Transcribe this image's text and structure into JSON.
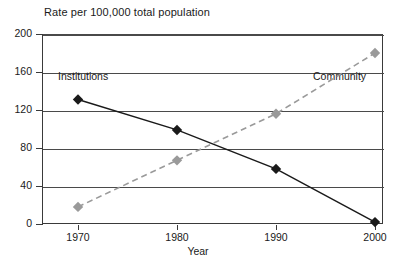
{
  "chart_data": {
    "type": "line",
    "title": "Rate per 100,000 total population",
    "xlabel": "Year",
    "ylabel": "",
    "categories": [
      "1970",
      "1980",
      "1990",
      "2000"
    ],
    "x": [
      1970,
      1980,
      1990,
      2000
    ],
    "xlim": [
      1970,
      2000
    ],
    "ylim": [
      0,
      200
    ],
    "yticks": [
      0,
      40,
      80,
      120,
      160,
      200
    ],
    "ytick_labels": [
      "0",
      "40",
      "80",
      "120",
      "160",
      "200"
    ],
    "grid": true,
    "legend_position": "inline-annotations",
    "series": [
      {
        "name": "Institutions",
        "values": [
          131,
          99,
          58,
          2
        ],
        "color": "#1a1a1a",
        "line_style": "solid",
        "marker": "diamond"
      },
      {
        "name": "Community",
        "values": [
          18,
          67,
          116,
          180
        ],
        "color": "#9a9a9a",
        "line_style": "dashed",
        "marker": "diamond"
      }
    ],
    "annotations": [
      {
        "text": "Institutions",
        "series": "Institutions"
      },
      {
        "text": "Community",
        "series": "Community"
      }
    ]
  },
  "axes": {
    "y_labels": [
      "200",
      "160",
      "120",
      "80",
      "40",
      "0"
    ],
    "x_labels": [
      "1970",
      "1980",
      "1990",
      "2000"
    ],
    "x_title": "Year"
  },
  "title": "Rate per 100,000 total population",
  "colors": {
    "institutions": "#1a1a1a",
    "community": "#9a9a9a",
    "axis": "#3a3a3a",
    "grid": "#4a4a4a",
    "background": "#ffffff"
  }
}
